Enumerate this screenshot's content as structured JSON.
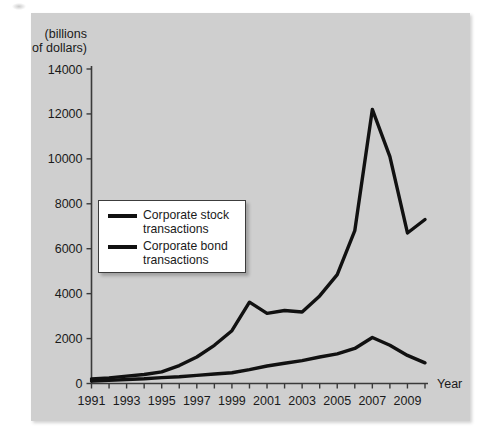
{
  "chart_data": {
    "type": "line",
    "title": "",
    "subtitle": "",
    "xlabel": "Year",
    "ylabel": "(billions\nof dollars)",
    "ylabel_line1": "(billions",
    "ylabel_line2": "of dollars)",
    "xlim": [
      1991,
      2010
    ],
    "ylim": [
      0,
      14000
    ],
    "grid": false,
    "legend_position": "inside-left",
    "ytick_labels": [
      "14000",
      "12000",
      "10000",
      "8000",
      "6000",
      "4000",
      "2000",
      "0"
    ],
    "yticks": [
      14000,
      12000,
      10000,
      8000,
      6000,
      4000,
      2000,
      0
    ],
    "xtick_labels": [
      "1991",
      "1993",
      "1995",
      "1997",
      "1999",
      "2001",
      "2003",
      "2005",
      "2007",
      "2009"
    ],
    "xticks": [
      1991,
      1993,
      1995,
      1997,
      1999,
      2001,
      2003,
      2005,
      2007,
      2009
    ],
    "x": [
      1991,
      1992,
      1993,
      1994,
      1995,
      1996,
      1997,
      1998,
      1999,
      2000,
      2001,
      2002,
      2003,
      2004,
      2005,
      2006,
      2007,
      2008,
      2009,
      2010
    ],
    "series": [
      {
        "name": "Corporate stock transactions",
        "color": "#111111",
        "values": [
          200,
          250,
          330,
          400,
          520,
          800,
          1180,
          1700,
          2350,
          3620,
          3120,
          3250,
          3180,
          3900,
          4850,
          6800,
          12200,
          10100,
          6700,
          7300
        ]
      },
      {
        "name": "Corporate bond transactions",
        "color": "#111111",
        "values": [
          110,
          140,
          180,
          210,
          260,
          300,
          360,
          420,
          480,
          620,
          780,
          900,
          1020,
          1180,
          1320,
          1560,
          2050,
          1700,
          1250,
          920
        ]
      }
    ]
  },
  "legend": {
    "items": [
      {
        "label": "Corporate stock\ntransactions"
      },
      {
        "label": "Corporate bond\ntransactions"
      }
    ]
  }
}
